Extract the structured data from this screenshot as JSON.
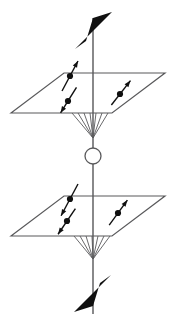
{
  "figure": {
    "width": 175,
    "height": 324,
    "background_color": "#ffffff",
    "line_color": "#59595b",
    "fill_color": "#101010",
    "caption": ""
  },
  "axis": {
    "name": "vertical-axis",
    "x": 93,
    "top_y": 18,
    "bottom_y": 314,
    "stroke_width": 1.6,
    "color": "#6b6b6d",
    "top_arrow": {
      "name": "top-arrowhead",
      "direction": "up",
      "points": "93,18 112,12 75,49 86,41",
      "fill": "#101010"
    },
    "bottom_arrow": {
      "name": "bottom-arrowhead",
      "direction": "down",
      "points": "93,306 74,312 111,275 100,283",
      "fill": "#101010"
    }
  },
  "center_circle": {
    "name": "center-circle",
    "cx": 93,
    "cy": 156,
    "r": 8,
    "stroke": "#59595b",
    "stroke_width": 1.3,
    "fill": "none"
  },
  "planes": [
    {
      "name": "upper-plane",
      "label": "upper plane",
      "polygon": "11,113 64,73 165,73 112,113",
      "stroke": "#59595b",
      "stroke_width": 1.2,
      "cone": {
        "name": "upper-cone",
        "apex_x": 93,
        "apex_y": 138,
        "base_y": 113,
        "base_xs": [
          72,
          78,
          84,
          90,
          96,
          102,
          108
        ]
      },
      "spins": [
        {
          "name": "spin-marker-upper-left-top",
          "dot_x": 70,
          "dot_y": 76,
          "dot_r": 3.1,
          "angle_deg": -62,
          "len_up": 17,
          "len_down": 17,
          "head": "up"
        },
        {
          "name": "spin-marker-upper-left-bottom",
          "dot_x": 68,
          "dot_y": 101,
          "dot_r": 3.1,
          "angle_deg": -58,
          "len_up": 16,
          "len_down": 14,
          "head": "down"
        },
        {
          "name": "spin-marker-upper-right",
          "dot_x": 120,
          "dot_y": 94,
          "dot_r": 3.1,
          "angle_deg": -52,
          "len_up": 17,
          "len_down": 14,
          "head": "up"
        }
      ]
    },
    {
      "name": "lower-plane",
      "label": "lower plane",
      "polygon": "11,236 64,196 165,196 112,236",
      "stroke": "#59595b",
      "stroke_width": 1.2,
      "cone": {
        "name": "lower-cone",
        "apex_x": 93,
        "apex_y": 259,
        "base_y": 236,
        "base_xs": [
          74,
          80,
          86,
          92,
          98,
          104,
          110
        ]
      },
      "spins": [
        {
          "name": "spin-marker-lower-left-top",
          "dot_x": 70,
          "dot_y": 199,
          "dot_r": 3.1,
          "angle_deg": -62,
          "len_up": 17,
          "len_down": 19,
          "head": "down"
        },
        {
          "name": "spin-marker-lower-left-bottom",
          "dot_x": 67,
          "dot_y": 221,
          "dot_r": 3.1,
          "angle_deg": -56,
          "len_up": 15,
          "len_down": 16,
          "head": "down"
        },
        {
          "name": "spin-marker-lower-right",
          "dot_x": 118,
          "dot_y": 213,
          "dot_r": 3.1,
          "angle_deg": -54,
          "len_up": 16,
          "len_down": 15,
          "head": "up"
        }
      ]
    }
  ]
}
